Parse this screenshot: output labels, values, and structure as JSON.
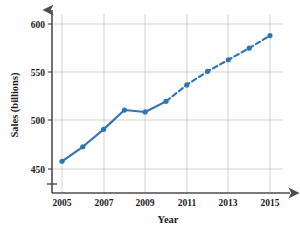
{
  "chart_data": {
    "type": "line",
    "title": "",
    "xlabel": "Year",
    "ylabel": "Sales (billions)",
    "x": [
      2005,
      2006,
      2007,
      2008,
      2009,
      2010,
      2011,
      2012,
      2013,
      2014,
      2015
    ],
    "values": [
      458,
      473,
      491,
      511,
      509,
      520,
      537,
      551,
      563,
      575,
      588
    ],
    "series": [
      {
        "name": "Actual sales",
        "style": "solid",
        "x": [
          2005,
          2006,
          2007,
          2008,
          2009,
          2010
        ],
        "values": [
          458,
          473,
          491,
          511,
          509,
          520
        ]
      },
      {
        "name": "Projected sales",
        "style": "dashed",
        "x": [
          2010,
          2011,
          2012,
          2013,
          2014,
          2015
        ],
        "values": [
          520,
          537,
          551,
          563,
          575,
          588
        ]
      }
    ],
    "xlim": [
      2004.4,
      2015.6
    ],
    "ylim": [
      437,
      607
    ],
    "xticks": [
      2005,
      2007,
      2009,
      2011,
      2013,
      2015
    ],
    "xtick_labels": [
      "2005",
      "2007",
      "2009",
      "2011",
      "2013",
      "2015"
    ],
    "yticks": [
      450,
      500,
      550,
      600
    ],
    "ytick_labels": [
      "450",
      "500",
      "550",
      "600"
    ],
    "grid": true,
    "grid_x_step": 2,
    "legend": "none",
    "y_axis_break": true,
    "color": "#2e75b6",
    "grid_color": "#bfbfbf",
    "axis_color": "#4d4d4d"
  },
  "axes": {
    "x_title": "Year",
    "y_title": "Sales (billions)"
  }
}
